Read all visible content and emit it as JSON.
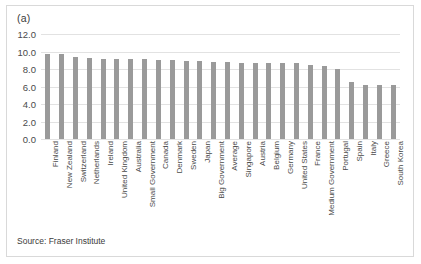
{
  "figure": {
    "panel_label": "(a)",
    "source_note": "Source: Fraser Institute"
  },
  "chart_data": {
    "type": "bar",
    "title": "(a)",
    "subtitle": "",
    "xlabel": "",
    "ylabel": "",
    "ylim": [
      0.0,
      12.0
    ],
    "ytick_step": 2.0,
    "ytick_labels": [
      "12.0",
      "10.0",
      "8.0",
      "6.0",
      "4.0",
      "2.0",
      "0.0"
    ],
    "ytick_values": [
      12.0,
      10.0,
      8.0,
      6.0,
      4.0,
      2.0,
      0.0
    ],
    "grid": true,
    "legend": false,
    "bar_color": "#9a9a9a",
    "gridline_color": "#e2e2e2",
    "categories": [
      "Finland",
      "New Zealand",
      "Switzerland",
      "Netherlands",
      "Ireland",
      "United Kingdom",
      "Australia",
      "Small Government",
      "Canada",
      "Denmark",
      "Sweden",
      "Japan",
      "Big Government",
      "Average",
      "Singapore",
      "Austria",
      "Belgium",
      "Germany",
      "United States",
      "France",
      "Medium Government",
      "Portugal",
      "Spain",
      "Italy",
      "Greece",
      "South Korea"
    ],
    "values": [
      9.7,
      9.7,
      9.4,
      9.2,
      9.1,
      9.1,
      9.1,
      9.1,
      9.0,
      9.0,
      8.9,
      8.9,
      8.8,
      8.8,
      8.7,
      8.7,
      8.7,
      8.7,
      8.7,
      8.5,
      8.3,
      8.0,
      6.5,
      6.2,
      6.2,
      6.2
    ],
    "source": "Fraser Institute"
  }
}
